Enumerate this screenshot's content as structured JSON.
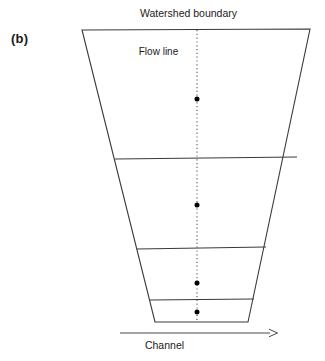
{
  "figure": {
    "panel_label": "(b)",
    "labels": {
      "watershed_boundary": "Watershed boundary",
      "flow_line": "Flow line",
      "channel": "Channel"
    },
    "colors": {
      "background": "#ffffff",
      "stroke": "#3a3a3a",
      "text": "#1a1a1a",
      "dot": "#000000"
    },
    "diagram_type": "watershed-schematic",
    "watershed_shape": {
      "name": "tapering-trapezoid",
      "top_left": [
        82,
        30
      ],
      "top_right": [
        310,
        29
      ],
      "bottom_right": [
        248,
        322
      ],
      "bottom_left": [
        155,
        322
      ]
    },
    "contour_lines": [
      {
        "name": "contour-1",
        "y": 159,
        "x_start": 115,
        "x_end": 297
      },
      {
        "name": "contour-2",
        "y": 249,
        "x_start": 137,
        "x_end": 266
      },
      {
        "name": "contour-3",
        "y": 300,
        "x_start": 150,
        "x_end": 254
      }
    ],
    "flow_line": {
      "x": 197,
      "y_start": 30,
      "y_end": 322,
      "style": "dotted"
    },
    "flow_points": [
      {
        "name": "flow-point-1",
        "x": 197,
        "y": 99
      },
      {
        "name": "flow-point-2",
        "x": 197,
        "y": 205
      },
      {
        "name": "flow-point-3",
        "x": 197,
        "y": 283
      },
      {
        "name": "flow-point-4",
        "x": 197,
        "y": 312
      }
    ],
    "channel_arrow": {
      "x_start": 120,
      "x_end": 278,
      "y": 333,
      "direction": "right",
      "head_style": "open"
    }
  }
}
